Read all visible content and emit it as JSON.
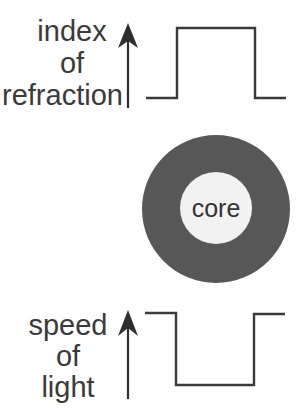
{
  "diagram": {
    "top_profile": {
      "label_lines": [
        "index",
        "of",
        "refraction"
      ],
      "axis": "up-arrow",
      "shape": "step-up (high inside core)"
    },
    "cross_section": {
      "core_label": "core",
      "cladding_color": "#555555",
      "core_color": "#f2f2f2"
    },
    "bottom_profile": {
      "label_lines": [
        "speed",
        "of",
        "light"
      ],
      "axis": "up-arrow",
      "shape": "step-down (low inside core)"
    }
  }
}
